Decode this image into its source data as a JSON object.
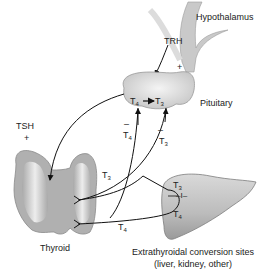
{
  "diagram": {
    "labels": {
      "hypothalamus": "Hypothalamus",
      "trh": "TRH",
      "trh_sign": "+",
      "pituitary": "Pituitary",
      "tsh": "TSH",
      "tsh_sign": "+",
      "thyroid": "Thyroid",
      "extrathyroidal_line1": "Extrathyroidal conversion sites",
      "extrathyroidal_line2": "(liver, kidney, other)"
    },
    "hormones": {
      "t_letter": "T",
      "four": "4",
      "three": "3"
    },
    "feedback": {
      "t4_sign": "–",
      "t3_sign": "–"
    },
    "deiodinase": "–I–",
    "colors": {
      "organ_fill": "#bdbdbd",
      "organ_light": "#e6e6e6",
      "organ_edge": "#8a8a8a",
      "line": "#111111"
    }
  }
}
